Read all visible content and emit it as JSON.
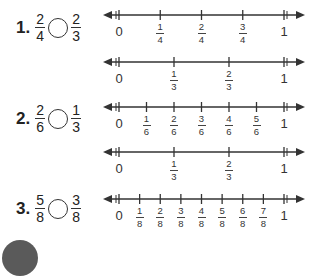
{
  "problems": [
    {
      "number": "1.",
      "left": {
        "num": "2",
        "den": "4"
      },
      "right": {
        "num": "2",
        "den": "3"
      },
      "top": 22
    },
    {
      "number": "2.",
      "left": {
        "num": "2",
        "den": "6"
      },
      "right": {
        "num": "1",
        "den": "3"
      },
      "top": 113
    },
    {
      "number": "3.",
      "left": {
        "num": "5",
        "den": "8"
      },
      "right": {
        "num": "3",
        "den": "8"
      },
      "top": 203
    }
  ],
  "number_lines": [
    {
      "id": "fourths",
      "y": 15,
      "start_label": "0",
      "end_label": "1",
      "ticks": [
        {
          "num": "1",
          "den": "4"
        },
        {
          "num": "2",
          "den": "4"
        },
        {
          "num": "3",
          "den": "4"
        }
      ]
    },
    {
      "id": "thirds-a",
      "y": 62,
      "start_label": "0",
      "end_label": "1",
      "ticks": [
        {
          "num": "1",
          "den": "3"
        },
        {
          "num": "2",
          "den": "3"
        }
      ]
    },
    {
      "id": "sixths",
      "y": 107,
      "start_label": "0",
      "end_label": "1",
      "ticks": [
        {
          "num": "1",
          "den": "6"
        },
        {
          "num": "2",
          "den": "6"
        },
        {
          "num": "3",
          "den": "6"
        },
        {
          "num": "4",
          "den": "6"
        },
        {
          "num": "5",
          "den": "6"
        }
      ]
    },
    {
      "id": "thirds-b",
      "y": 152,
      "start_label": "0",
      "end_label": "1",
      "ticks": [
        {
          "num": "1",
          "den": "3"
        },
        {
          "num": "2",
          "den": "3"
        }
      ]
    },
    {
      "id": "eighths",
      "y": 199,
      "start_label": "0",
      "end_label": "1",
      "ticks": [
        {
          "num": "1",
          "den": "8"
        },
        {
          "num": "2",
          "den": "8"
        },
        {
          "num": "3",
          "den": "8"
        },
        {
          "num": "4",
          "den": "8"
        },
        {
          "num": "5",
          "den": "8"
        },
        {
          "num": "6",
          "den": "8"
        },
        {
          "num": "7",
          "den": "8"
        }
      ]
    }
  ]
}
